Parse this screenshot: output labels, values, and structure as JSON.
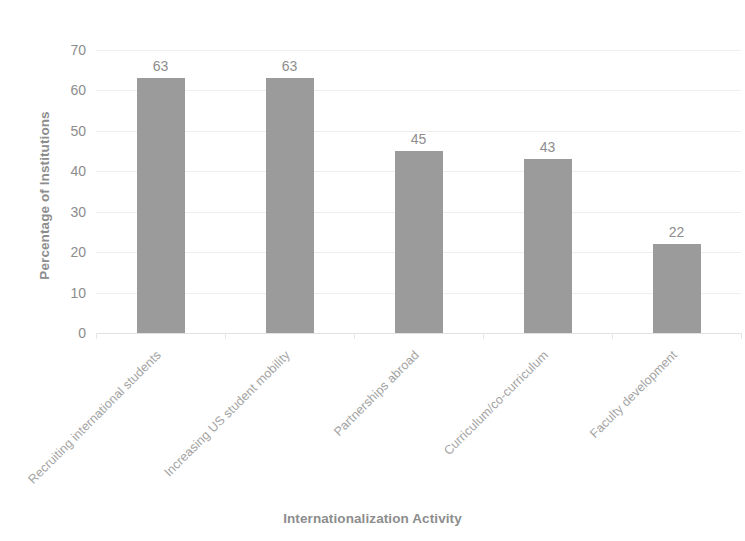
{
  "chart_data": {
    "type": "bar",
    "title": "",
    "categories": [
      "Recruiting international students",
      "Increasing US student mobility",
      "Partnerships abroad",
      "Curriculum/co-curriculum",
      "Faculty development"
    ],
    "values": [
      63,
      63,
      45,
      43,
      22
    ],
    "value_labels": [
      "63",
      "63",
      "45",
      "43",
      "22"
    ],
    "xlabel": "Internationalization Activity",
    "ylabel": "Percentage of Institutions",
    "ylim": [
      0,
      70
    ],
    "ytick_labels": [
      "70",
      "60",
      "50",
      "40",
      "30",
      "20",
      "10",
      "0"
    ],
    "ytick_values": [
      70,
      60,
      50,
      40,
      30,
      20,
      10,
      0
    ],
    "grid": true,
    "grid_axis": "y",
    "legend": false,
    "legend_position": "none",
    "bar_color": "#9b9b9b",
    "text_color": "#8d8d8d",
    "category_label_color": "#a3a3a3",
    "gridline_color": "#eeeeee",
    "background_color": "#ffffff",
    "category_label_rotation": -45
  }
}
